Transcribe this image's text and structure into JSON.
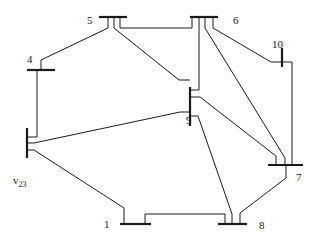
{
  "diagram": {
    "type": "power-system network",
    "buses": [
      {
        "id": "1",
        "label": "1"
      },
      {
        "id": "4",
        "label": "4"
      },
      {
        "id": "5",
        "label": "5"
      },
      {
        "id": "6",
        "label": "6"
      },
      {
        "id": "7",
        "label": "7"
      },
      {
        "id": "8",
        "label": "8"
      },
      {
        "id": "9",
        "label": "9"
      },
      {
        "id": "10",
        "label": "10"
      },
      {
        "id": "v23",
        "label_main": "v",
        "label_sub": "23"
      }
    ],
    "lines": [
      {
        "from": "5",
        "to": "4"
      },
      {
        "from": "5",
        "to": "6"
      },
      {
        "from": "5",
        "to": "9"
      },
      {
        "from": "6",
        "to": "9"
      },
      {
        "from": "6",
        "to": "7"
      },
      {
        "from": "6",
        "to": "10"
      },
      {
        "from": "10",
        "to": "7"
      },
      {
        "from": "4",
        "to": "v23"
      },
      {
        "from": "v23",
        "to": "9"
      },
      {
        "from": "v23",
        "to": "1"
      },
      {
        "from": "9",
        "to": "7"
      },
      {
        "from": "9",
        "to": "8"
      },
      {
        "from": "1",
        "to": "8"
      },
      {
        "from": "7",
        "to": "8"
      }
    ]
  }
}
